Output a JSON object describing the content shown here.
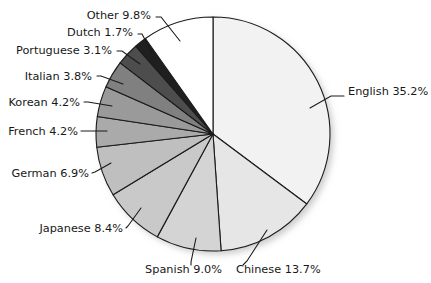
{
  "chart_data": {
    "type": "pie",
    "title": "",
    "xlabel": "",
    "ylabel": "",
    "legend": "none",
    "grid": false,
    "units": "percent",
    "start_angle_deg": 0,
    "direction": "clockwise",
    "categories": [
      "English",
      "Chinese",
      "Spanish",
      "Japanese",
      "German",
      "French",
      "Korean",
      "Italian",
      "Portuguese",
      "Dutch",
      "Other"
    ],
    "values": [
      35.2,
      13.7,
      9.0,
      8.4,
      6.9,
      4.2,
      4.2,
      3.8,
      3.1,
      1.7,
      9.8
    ],
    "slices": [
      {
        "label": "English",
        "value": 35.2,
        "label_text": "English 35.2%",
        "color": "#f2f2f2",
        "label_x": 348,
        "label_y": 95,
        "anchor": "start",
        "lx1": 310,
        "ly1": 108,
        "lx2": 331,
        "ly2": 96,
        "lx3": 344,
        "ly3": 96
      },
      {
        "label": "Chinese",
        "value": 13.7,
        "label_text": "Chinese 13.7%",
        "color": "#e6e6e6",
        "label_x": 236,
        "label_y": 273,
        "anchor": "start",
        "lx1": 267,
        "ly1": 230,
        "lx2": 247,
        "ly2": 261,
        "lx3": 243,
        "ly3": 265
      },
      {
        "label": "Spanish",
        "value": 9.0,
        "label_text": "Spanish 9.0%",
        "color": "#d4d4d4",
        "label_x": 222,
        "label_y": 273,
        "anchor": "end",
        "lx1": 196,
        "ly1": 238,
        "lx2": 191,
        "ly2": 262,
        "lx3": 191,
        "ly3": 265
      },
      {
        "label": "Japanese",
        "value": 8.4,
        "label_text": "Japanese 8.4%",
        "color": "#c9c9c9",
        "label_x": 123,
        "label_y": 232,
        "anchor": "end",
        "lx1": 141,
        "ly1": 208,
        "lx2": 128,
        "ly2": 226,
        "lx3": 126,
        "ly3": 228
      },
      {
        "label": "German",
        "value": 6.9,
        "label_text": "German 6.9%",
        "color": "#bfbfbf",
        "label_x": 89,
        "label_y": 177,
        "anchor": "end",
        "lx1": 111,
        "ly1": 163,
        "lx2": 95,
        "ly2": 172,
        "lx3": 92,
        "ly3": 173
      },
      {
        "label": "French",
        "value": 4.2,
        "label_text": "French 4.2%",
        "color": "#aaaaaa",
        "label_x": 78,
        "label_y": 135,
        "anchor": "end",
        "lx1": 107,
        "ly1": 131,
        "lx2": 84,
        "ly2": 131,
        "lx3": 81,
        "ly3": 131
      },
      {
        "label": "Korean",
        "value": 4.2,
        "label_text": "Korean 4.2%",
        "color": "#9a9a9a",
        "label_x": 80,
        "label_y": 106,
        "anchor": "end",
        "lx1": 112,
        "ly1": 106,
        "lx2": 88,
        "ly2": 102,
        "lx3": 84,
        "ly3": 102
      },
      {
        "label": "Italian",
        "value": 3.8,
        "label_text": "Italian 3.8%",
        "color": "#808080",
        "label_x": 92,
        "label_y": 80,
        "anchor": "end",
        "lx1": 123,
        "ly1": 84,
        "lx2": 101,
        "ly2": 76,
        "lx3": 97,
        "ly3": 76
      },
      {
        "label": "Portuguese",
        "value": 3.1,
        "label_text": "Portuguese 3.1%",
        "color": "#4d4d4d",
        "label_x": 112,
        "label_y": 54,
        "anchor": "end",
        "lx1": 140,
        "ly1": 64,
        "lx2": 122,
        "ly2": 51,
        "lx3": 117,
        "ly3": 51
      },
      {
        "label": "Dutch",
        "value": 1.7,
        "label_text": "Dutch 1.7%",
        "color": "#1f1f1f",
        "label_x": 133,
        "label_y": 36,
        "anchor": "end",
        "lx1": 152,
        "ly1": 53,
        "lx2": 142,
        "ly2": 34,
        "lx3": 138,
        "ly3": 34
      },
      {
        "label": "Other",
        "value": 9.8,
        "label_text": "Other 9.8%",
        "color": "#ffffff",
        "label_x": 151,
        "label_y": 19,
        "anchor": "end",
        "lx1": 180,
        "ly1": 41,
        "lx2": 161,
        "ly2": 17,
        "lx3": 156,
        "ly3": 17
      }
    ],
    "geometry": {
      "cx": 213,
      "cy": 134,
      "r": 117
    }
  },
  "chart": {
    "title": ""
  }
}
